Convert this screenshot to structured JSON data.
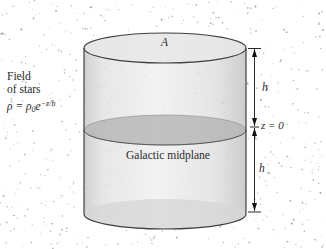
{
  "figure": {
    "top_area_label": "A",
    "field_of_stars": {
      "line1": "Field",
      "line2": "of stars"
    },
    "density_formula": {
      "lhs": "ρ = ρ",
      "sub": "0",
      "base": "e",
      "exp": "−z/h"
    },
    "midplane_label": "Galactic midplane",
    "z_equals_zero": "z = 0",
    "scale_height_upper": "h",
    "scale_height_lower": "h"
  },
  "colors": {
    "background": "#ffffff",
    "star": "#8a8a8a",
    "cylinder_outline": "#3f3f3f",
    "top_cap_fill": "#e7e7e7",
    "midplane_fill": "#b4b4b4",
    "midplane_edge": "#5a5a5a",
    "bottom_cap_fill": "#d6d6d6",
    "dimension": "#111111",
    "text": "#2a2a2a"
  },
  "stars": {
    "count": 680,
    "seed": 1234
  }
}
